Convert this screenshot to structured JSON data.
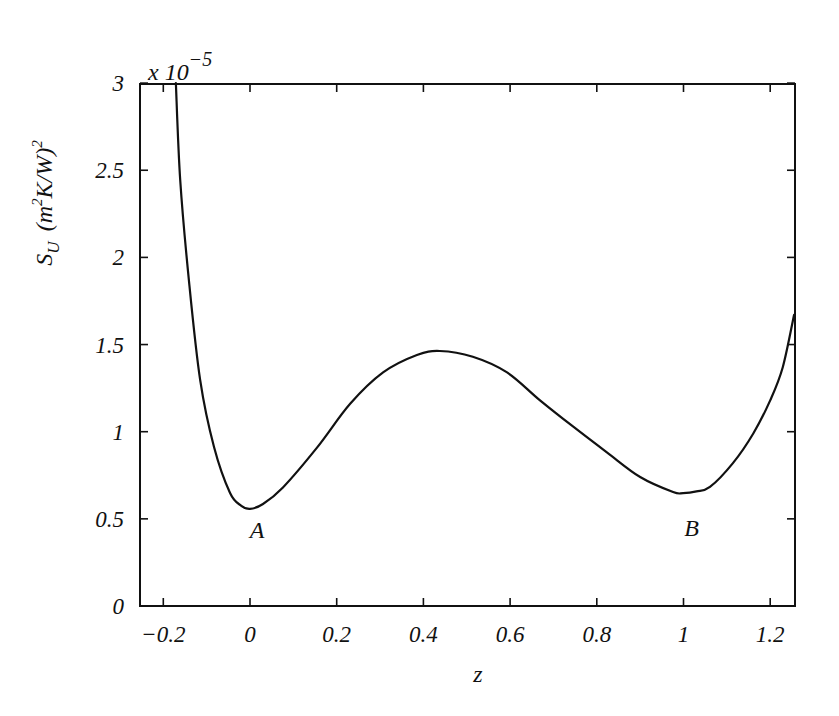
{
  "chart_data": {
    "type": "line",
    "title": "",
    "xlabel": "z",
    "ylabel": "S_U (m^2K/W)^2",
    "ylabel_parts": {
      "main": "S",
      "sub": "U",
      "units_open": "(m",
      "sup1": "2",
      "units_mid": "K/W)",
      "sup2": "2"
    },
    "y_scale_label": {
      "base": "x 10",
      "exponent": "−5"
    },
    "xlim": [
      -0.254,
      1.255
    ],
    "ylim": [
      0,
      3
    ],
    "grid": false,
    "legend": null,
    "x_ticks": [
      -0.2,
      0,
      0.2,
      0.4,
      0.6,
      0.8,
      1,
      1.2
    ],
    "x_tick_labels": [
      "−0.2",
      "0",
      "0.2",
      "0.4",
      "0.6",
      "0.8",
      "1",
      "1.2"
    ],
    "y_ticks": [
      0,
      0.5,
      1,
      1.5,
      2,
      2.5,
      3
    ],
    "y_tick_labels": [
      "0",
      "0.5",
      "1",
      "1.5",
      "2",
      "2.5",
      "3"
    ],
    "series": [
      {
        "name": "S_U",
        "color": "#111111",
        "x": [
          -0.171,
          -0.161,
          -0.141,
          -0.115,
          -0.083,
          -0.046,
          -0.02,
          0.0,
          0.03,
          0.076,
          0.155,
          0.231,
          0.307,
          0.385,
          0.438,
          0.514,
          0.593,
          0.669,
          0.745,
          0.824,
          0.9,
          0.976,
          0.999,
          1.03,
          1.061,
          1.114,
          1.161,
          1.2,
          1.229,
          1.255
        ],
        "y": [
          3.0,
          2.444,
          1.87,
          1.297,
          0.912,
          0.648,
          0.575,
          0.557,
          0.585,
          0.68,
          0.91,
          1.16,
          1.34,
          1.44,
          1.463,
          1.43,
          1.34,
          1.18,
          1.03,
          0.88,
          0.74,
          0.654,
          0.648,
          0.658,
          0.683,
          0.82,
          0.99,
          1.18,
          1.37,
          1.67
        ]
      }
    ],
    "annotations": [
      {
        "text": "A",
        "x": 0.0,
        "y": 0.55,
        "note": "local minimum"
      },
      {
        "text": "B",
        "x": 1.0,
        "y": 0.648,
        "note": "local minimum"
      }
    ]
  },
  "layout": {
    "plot": {
      "left": 140,
      "top": 84,
      "right": 795,
      "bottom": 606
    },
    "x_origin_px": 250,
    "x_px_per_unit": 433.5,
    "y_px_per_unit": 174.3
  }
}
